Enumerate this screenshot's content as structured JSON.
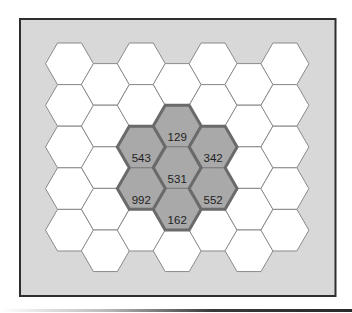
{
  "diagram": {
    "type": "hexagonal-grid",
    "frame": {
      "background": "#d8d8d8",
      "border_color": "#2e2e2e"
    },
    "grid": {
      "columns": 7,
      "rows_per_column": 5,
      "hex_side": 24,
      "first_column_center_x": 69.5,
      "column_step": 35.9,
      "odd_column_top": 43,
      "even_column_top": 63.6,
      "row_step": 41.6,
      "cell_fill": "#ffffff",
      "cell_stroke": "#8a8a8a"
    },
    "highlight": {
      "fill": "#a9a9a9",
      "outline": "#6a6a6a",
      "inner_stroke": "#7c7c7c",
      "cells": [
        {
          "col": 3,
          "row": 1,
          "label": "129"
        },
        {
          "col": 2,
          "row": 2,
          "label": "543"
        },
        {
          "col": 4,
          "row": 2,
          "label": "342"
        },
        {
          "col": 3,
          "row": 2,
          "label": "531"
        },
        {
          "col": 2,
          "row": 3,
          "label": "992"
        },
        {
          "col": 4,
          "row": 3,
          "label": "552"
        },
        {
          "col": 3,
          "row": 3,
          "label": "162"
        }
      ]
    },
    "labels": {
      "top": "129",
      "upper_left": "543",
      "upper_right": "342",
      "center": "531",
      "lower_left": "992",
      "lower_right": "552",
      "bottom": "162"
    }
  }
}
